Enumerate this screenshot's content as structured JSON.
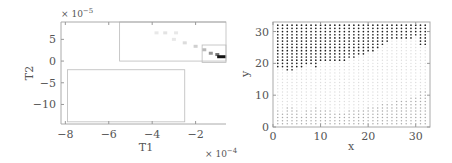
{
  "chart_data": [
    {
      "type": "heatmap",
      "title": "",
      "xlabel": "T1",
      "ylabel": "T2",
      "x_multiplier": "× 10^-4",
      "y_multiplier": "× 10^-5",
      "xticks": [
        "-8",
        "-6",
        "-4",
        "-2"
      ],
      "yticks": [
        "5",
        "0",
        "-5",
        "-10"
      ],
      "xlim": [
        -8.2,
        -0.6
      ],
      "ylim": [
        -14.5,
        9
      ],
      "grid": false,
      "rectangles": [
        {
          "x0": -5.5,
          "x1": -0.6,
          "y0": 0,
          "y1": 9
        },
        {
          "x0": -7.9,
          "x1": -2.5,
          "y0": -14,
          "y1": -2
        },
        {
          "x0": -1.7,
          "x1": -0.6,
          "y0": -0.3,
          "y1": 3.7
        }
      ],
      "density_cells": [
        {
          "x": -3.8,
          "y": 6.5,
          "shade": 0.1
        },
        {
          "x": -3.4,
          "y": 6.5,
          "shade": 0.12
        },
        {
          "x": -2.9,
          "y": 6.5,
          "shade": 0.1
        },
        {
          "x": -3.0,
          "y": 5.0,
          "shade": 0.1
        },
        {
          "x": -2.5,
          "y": 4.2,
          "shade": 0.15
        },
        {
          "x": -2.0,
          "y": 3.4,
          "shade": 0.2
        },
        {
          "x": -1.6,
          "y": 2.6,
          "shade": 0.3
        },
        {
          "x": -1.3,
          "y": 1.8,
          "shade": 0.45
        },
        {
          "x": -1.0,
          "y": 1.5,
          "shade": 0.6
        },
        {
          "x": -0.8,
          "y": 1.0,
          "shade": 1.0
        }
      ]
    },
    {
      "type": "scatter",
      "title": "",
      "xlabel": "x",
      "ylabel": "y",
      "xticks": [
        "0",
        "10",
        "20",
        "30"
      ],
      "yticks": [
        "0",
        "10",
        "20",
        "30"
      ],
      "xlim": [
        0,
        33
      ],
      "ylim": [
        0,
        33
      ],
      "grid": false,
      "series": [
        {
          "name": "upper region (dark)",
          "color": "#222222",
          "lower_boundary_y_by_x": [
            20,
            19,
            19,
            18,
            18,
            19,
            19,
            20,
            20,
            19,
            21,
            21,
            21,
            21,
            21,
            21,
            22,
            22,
            23,
            23,
            24,
            24,
            25,
            26,
            27,
            28,
            28,
            28,
            28,
            28,
            29,
            26,
            26
          ]
        },
        {
          "name": "middle region (light)",
          "color": "#dddddd"
        },
        {
          "name": "lower region (medium)",
          "color": "#aaaaaa",
          "upper_boundary_y_by_x": [
            5,
            5,
            4,
            6,
            6,
            5,
            3,
            5,
            5,
            6,
            5,
            5,
            5,
            4,
            4,
            4,
            5,
            5,
            5,
            5,
            6,
            6,
            6,
            7,
            7,
            7,
            8,
            8,
            8,
            9,
            9,
            11,
            11
          ]
        }
      ]
    }
  ]
}
